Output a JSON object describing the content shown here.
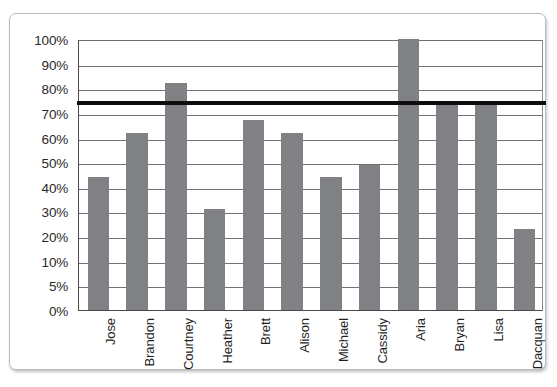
{
  "chart_data": {
    "type": "bar",
    "title": "",
    "subtitle": "",
    "xlabel": "",
    "ylabel": "",
    "categories": [
      "Jose",
      "Brandon",
      "Courtney",
      "Heather",
      "Brett",
      "Alison",
      "Michael",
      "Cassidy",
      "Aria",
      "Bryan",
      "Lisa",
      "Dacquan"
    ],
    "values": [
      44,
      62,
      82,
      31,
      67,
      62,
      44,
      49,
      100,
      74,
      74,
      23
    ],
    "value_unit": "%",
    "series": [
      {
        "name": "Score",
        "values": [
          44,
          62,
          82,
          31,
          67,
          62,
          44,
          49,
          100,
          74,
          74,
          23
        ],
        "color": "#808184"
      }
    ],
    "ytick_labels": [
      "100%",
      "90%",
      "80%",
      "70%",
      "60%",
      "50%",
      "40%",
      "30%",
      "20%",
      "10%",
      "5%",
      "0%"
    ],
    "ytick_values": [
      100,
      90,
      80,
      70,
      60,
      50,
      40,
      30,
      20,
      10,
      5,
      0
    ],
    "ylim": [
      0,
      100
    ],
    "yaxis_scale": "categorical-ticks-evenly-spaced",
    "grid": "horizontal",
    "legend": "none",
    "annotations": [
      {
        "name": "threshold-line",
        "type": "horizontal-line",
        "value": 75,
        "label": "75%",
        "color": "#0d0d0d",
        "thickness_px": 4
      }
    ],
    "bar_color": "#808184",
    "plot_background": "#ffffff",
    "gridline_color": "#6f7173",
    "axis_color": "#4a4a4a",
    "frame_color": "#b9bcbe"
  }
}
